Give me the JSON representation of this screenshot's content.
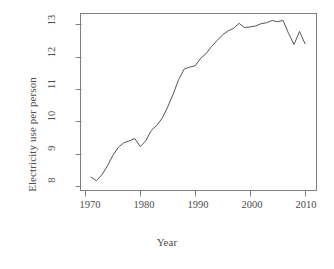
{
  "chart_data": {
    "type": "line",
    "title": "",
    "xlabel": "Year",
    "ylabel": "Electricity use per person",
    "xlim": [
      1969.2,
      2012.0
    ],
    "ylim": [
      7.88,
      13.32
    ],
    "xticks": [
      1970,
      1980,
      1990,
      2000,
      2010
    ],
    "yticks": [
      8,
      9,
      10,
      11,
      12,
      13
    ],
    "grid": false,
    "legend": null,
    "line_color": "#555555",
    "line_width": 1,
    "series": [
      {
        "name": "Electricity use per person",
        "x": [
          1971,
          1972,
          1973,
          1974,
          1975,
          1976,
          1977,
          1978,
          1979,
          1980,
          1981,
          1982,
          1983,
          1984,
          1985,
          1986,
          1987,
          1988,
          1989,
          1990,
          1991,
          1992,
          1993,
          1994,
          1995,
          1996,
          1997,
          1998,
          1999,
          2000,
          2001,
          2002,
          2003,
          2004,
          2005,
          2006,
          2007,
          2008,
          2009,
          2010
        ],
        "y": [
          8.28,
          8.17,
          8.35,
          8.62,
          8.95,
          9.2,
          9.34,
          9.4,
          9.47,
          9.22,
          9.4,
          9.72,
          9.88,
          10.1,
          10.45,
          10.85,
          11.3,
          11.62,
          11.68,
          11.72,
          11.95,
          12.1,
          12.32,
          12.5,
          12.68,
          12.8,
          12.88,
          13.03,
          12.9,
          12.92,
          12.95,
          13.02,
          13.05,
          13.12,
          13.08,
          13.12,
          12.72,
          12.38,
          12.78,
          12.4
        ]
      }
    ]
  },
  "axis": {
    "x_tick_labels": [
      "1970",
      "1980",
      "1990",
      "2000",
      "2010"
    ],
    "y_tick_labels": [
      "8",
      "9",
      "10",
      "11",
      "12",
      "13"
    ],
    "x_title": "Year",
    "y_title": "Electricity use per person"
  },
  "style": {
    "frame_color": "#808080",
    "text_color": "#4d4d4d",
    "line_color": "#555555",
    "background": "#ffffff"
  }
}
